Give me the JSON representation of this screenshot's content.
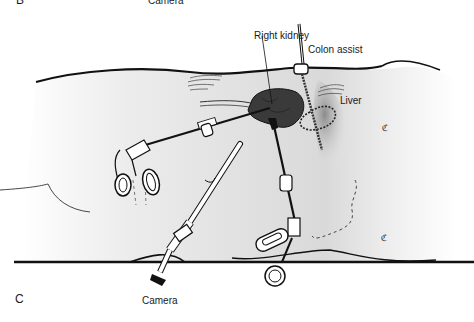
{
  "top_caption": {
    "panel_letter": "B",
    "label": "Camera"
  },
  "figure": {
    "panel_letter": "C",
    "labels": {
      "right_kidney": "Right kidney",
      "colon_assist": "Colon assist",
      "liver": "Liver",
      "camera": "Camera"
    }
  },
  "colors": {
    "ink": "#111111",
    "body_fill": "#e6e6e6",
    "kidney_fill": "#3a3a3a",
    "background": "#ffffff"
  }
}
